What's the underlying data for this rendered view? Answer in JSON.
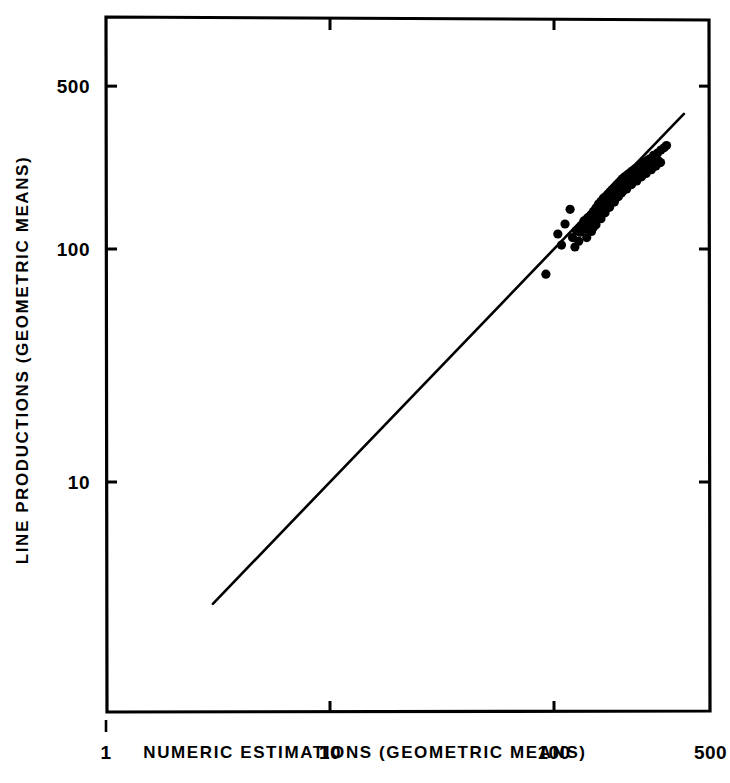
{
  "chart_data": {
    "type": "scatter",
    "title": "",
    "xlabel": "NUMERIC  ESTIMATIONS  (GEOMETRIC MEANS)",
    "ylabel": "LINE  PRODUCTIONS  (GEOMETRIC  MEANS)",
    "xscale": "log",
    "yscale": "log",
    "xlim": [
      1,
      500
    ],
    "ylim": [
      2.2,
      800
    ],
    "grid": false,
    "legend": "none",
    "x_ticks": [
      {
        "value": 1,
        "label": "1"
      },
      {
        "value": 10,
        "label": "10"
      },
      {
        "value": 100,
        "label": "100"
      },
      {
        "value": 500,
        "label": "500"
      }
    ],
    "y_ticks": [
      {
        "value": 10,
        "label": "10"
      },
      {
        "value": 100,
        "label": "100"
      },
      {
        "value": 500,
        "label": "500"
      }
    ],
    "reference_line": {
      "name": "identity-line",
      "description": "straight diagonal fit line of slope 1",
      "x_start": 3.0,
      "y_start": 3.0,
      "x_end": 380.0,
      "y_end": 380.0
    },
    "series": [
      {
        "name": "observations",
        "marker": "filled-circle",
        "color": "#000000",
        "points": [
          [
            92,
            78
          ],
          [
            108,
            104
          ],
          [
            104,
            116
          ],
          [
            118,
            148
          ],
          [
            112,
            128
          ],
          [
            121,
            112
          ],
          [
            124,
            102
          ],
          [
            126,
            120
          ],
          [
            131,
            118
          ],
          [
            133,
            126
          ],
          [
            129,
            108
          ],
          [
            136,
            132
          ],
          [
            138,
            122
          ],
          [
            141,
            136
          ],
          [
            143,
            128
          ],
          [
            146,
            140
          ],
          [
            148,
            131
          ],
          [
            150,
            145
          ],
          [
            152,
            137
          ],
          [
            154,
            150
          ],
          [
            156,
            142
          ],
          [
            158,
            156
          ],
          [
            160,
            148
          ],
          [
            162,
            160
          ],
          [
            164,
            152
          ],
          [
            166,
            165
          ],
          [
            168,
            157
          ],
          [
            170,
            168
          ],
          [
            172,
            160
          ],
          [
            174,
            172
          ],
          [
            176,
            163
          ],
          [
            178,
            176
          ],
          [
            180,
            168
          ],
          [
            182,
            180
          ],
          [
            184,
            171
          ],
          [
            186,
            184
          ],
          [
            188,
            176
          ],
          [
            190,
            188
          ],
          [
            192,
            180
          ],
          [
            194,
            192
          ],
          [
            196,
            184
          ],
          [
            198,
            196
          ],
          [
            200,
            188
          ],
          [
            202,
            200
          ],
          [
            205,
            192
          ],
          [
            207,
            204
          ],
          [
            210,
            197
          ],
          [
            212,
            208
          ],
          [
            215,
            201
          ],
          [
            218,
            212
          ],
          [
            220,
            205
          ],
          [
            223,
            216
          ],
          [
            226,
            209
          ],
          [
            229,
            220
          ],
          [
            232,
            213
          ],
          [
            235,
            224
          ],
          [
            238,
            217
          ],
          [
            241,
            228
          ],
          [
            244,
            221
          ],
          [
            247,
            232
          ],
          [
            250,
            226
          ],
          [
            254,
            236
          ],
          [
            257,
            230
          ],
          [
            261,
            240
          ],
          [
            264,
            234
          ],
          [
            268,
            244
          ],
          [
            150,
            124
          ],
          [
            155,
            133
          ],
          [
            160,
            141
          ],
          [
            165,
            149
          ],
          [
            170,
            155
          ],
          [
            175,
            163
          ],
          [
            180,
            159
          ],
          [
            185,
            170
          ],
          [
            190,
            166
          ],
          [
            195,
            178
          ],
          [
            200,
            174
          ],
          [
            206,
            185
          ],
          [
            211,
            181
          ],
          [
            217,
            193
          ],
          [
            222,
            189
          ],
          [
            228,
            200
          ],
          [
            234,
            196
          ],
          [
            240,
            208
          ],
          [
            246,
            204
          ],
          [
            252,
            215
          ],
          [
            258,
            211
          ],
          [
            265,
            223
          ],
          [
            272,
            219
          ],
          [
            278,
            231
          ],
          [
            285,
            227
          ],
          [
            292,
            239
          ],
          [
            299,
            235
          ],
          [
            140,
            112
          ],
          [
            147,
            119
          ],
          [
            154,
            127
          ],
          [
            162,
            135
          ],
          [
            169,
            143
          ],
          [
            177,
            151
          ],
          [
            186,
            159
          ],
          [
            194,
            168
          ],
          [
            203,
            177
          ],
          [
            213,
            186
          ],
          [
            222,
            196
          ],
          [
            232,
            206
          ],
          [
            243,
            217
          ],
          [
            254,
            228
          ],
          [
            266,
            240
          ],
          [
            278,
            252
          ],
          [
            290,
            258
          ],
          [
            300,
            266
          ],
          [
            310,
            272
          ],
          [
            318,
            278
          ]
        ]
      }
    ]
  },
  "figure": {
    "background_color": "#ffffff",
    "line_color": "#000000",
    "axis_color": "#000000"
  }
}
